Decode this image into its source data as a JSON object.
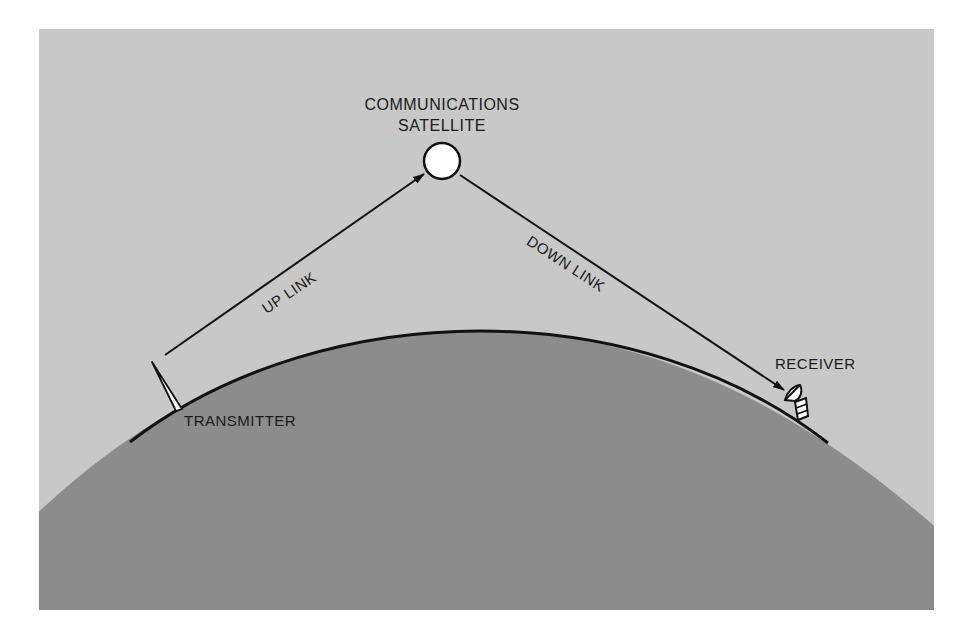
{
  "diagram": {
    "colors": {
      "page_background": "#ffffff",
      "sky": "#c8c8c8",
      "earth": "#8c8c8c",
      "line": "#111111",
      "satellite_fill": "#ffffff"
    },
    "nodes": {
      "satellite": {
        "label_line1": "COMMUNICATIONS",
        "label_line2": "SATELLITE",
        "icon": "satellite-circle-icon"
      },
      "transmitter": {
        "label": "TRANSMITTER",
        "icon": "antenna-icon"
      },
      "receiver": {
        "label": "RECEIVER",
        "icon": "dish-antenna-icon"
      }
    },
    "links": [
      {
        "id": "uplink",
        "label": "UP LINK",
        "from": "TRANSMITTER",
        "to": "COMMUNICATIONS SATELLITE"
      },
      {
        "id": "downlink",
        "label": "DOWN LINK",
        "from": "COMMUNICATIONS SATELLITE",
        "to": "RECEIVER"
      }
    ]
  }
}
